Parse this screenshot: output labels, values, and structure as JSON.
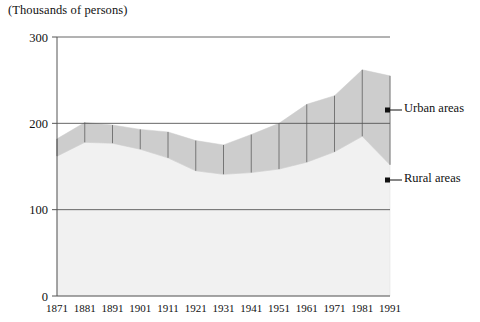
{
  "axis_unit_note": "(Thousands of persons)",
  "legend": {
    "urban_label": "Urban areas",
    "rural_label": "Rural areas"
  },
  "colors": {
    "urban_fill": "#cdcdcd",
    "rural_fill": "#f1f1f1",
    "axis": "#555555",
    "tickline": "#6b6b6b",
    "text": "#111111"
  },
  "chart_data": {
    "type": "area",
    "stacked": true,
    "title": "",
    "subtitle": "",
    "xlabel": "",
    "ylabel": "(Thousands of persons)",
    "ylim": [
      0,
      300
    ],
    "yticks": [
      0,
      100,
      200,
      300
    ],
    "ytick_labels": [
      "0",
      "100",
      "200",
      "300"
    ],
    "grid": false,
    "legend_position": "right",
    "categories": [
      1871,
      1881,
      1891,
      1901,
      1911,
      1921,
      1931,
      1941,
      1951,
      1961,
      1971,
      1981,
      1991
    ],
    "xtick_labels": [
      "1871",
      "1881",
      "1891",
      "1901",
      "1911",
      "1921",
      "1931",
      "1941",
      "1951",
      "1961",
      "1971",
      "1981",
      "1991"
    ],
    "series": [
      {
        "name": "Rural areas",
        "values": [
          162,
          178,
          177,
          170,
          160,
          145,
          141,
          143,
          147,
          155,
          167,
          185,
          152
        ]
      },
      {
        "name": "Urban areas",
        "values": [
          20,
          23,
          21,
          23,
          30,
          35,
          34,
          44,
          53,
          67,
          65,
          77,
          103
        ]
      }
    ],
    "totals": [
      182,
      201,
      198,
      193,
      190,
      180,
      175,
      187,
      200,
      222,
      232,
      262,
      255
    ],
    "annotations": []
  }
}
